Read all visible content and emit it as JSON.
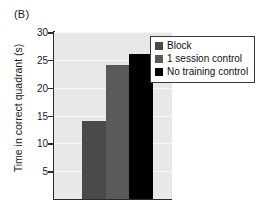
{
  "panel": {
    "label": "(B)"
  },
  "chart_data": {
    "type": "bar",
    "title": "",
    "subtitle": "",
    "panel_label": "(B)",
    "xlabel": "",
    "ylabel": "Time in correct quadrant (s)",
    "categories": [
      "Block",
      "1 session control",
      "No training control"
    ],
    "values": [
      14,
      24,
      26
    ],
    "series": [
      {
        "name": "Time in correct quadrant",
        "values": [
          14,
          24,
          26
        ]
      }
    ],
    "ylim": [
      0,
      30
    ],
    "ytick_labels": [
      "5",
      "10",
      "15",
      "20",
      "25",
      "30"
    ],
    "yticks": [
      5,
      10,
      15,
      20,
      25,
      30
    ],
    "xtick_labels": [],
    "grid": true,
    "grid_axis": "y",
    "legend_position": "top-right",
    "legend": [
      {
        "label": "Block",
        "color": "#4a4a4a"
      },
      {
        "label": "1 session control",
        "color": "#5a5a5a"
      },
      {
        "label": "No training control",
        "color": "#000000"
      }
    ],
    "bars": [
      {
        "label": "Block",
        "value": 14,
        "color": "#4a4a4a"
      },
      {
        "label": "1 session control",
        "value": 24,
        "color": "#5a5a5a"
      },
      {
        "label": "No training control",
        "value": 26,
        "color": "#000000"
      }
    ],
    "plot_background": "#e8e8e8",
    "axis_color": "#2b2b2b"
  }
}
